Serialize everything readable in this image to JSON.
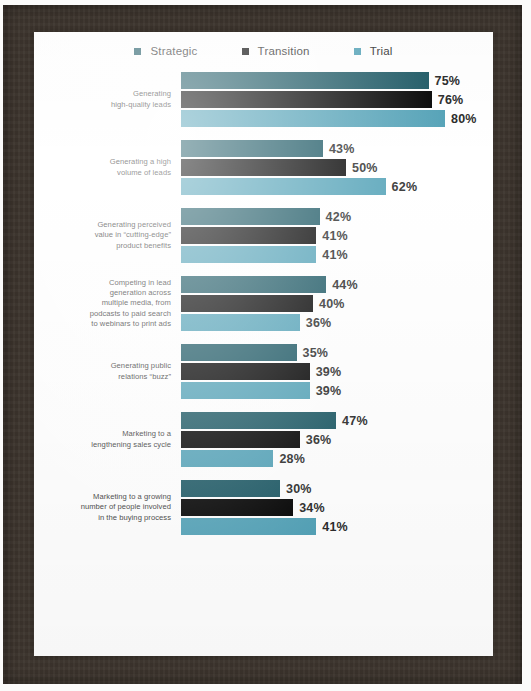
{
  "frame": {
    "border_color": "#3c342d",
    "page_color": "#ffffff"
  },
  "legend": {
    "position": "top-center",
    "items": [
      {
        "label": "Strategic",
        "color": "#1f5a66"
      },
      {
        "label": "Transition",
        "color": "#050505"
      },
      {
        "label": "Trial",
        "color": "#55a3b8"
      }
    ]
  },
  "chart_data": {
    "type": "bar",
    "orientation": "horizontal",
    "title": "",
    "subtitle": "",
    "xlabel": "",
    "ylabel": "",
    "xlim": [
      0,
      100
    ],
    "grid": false,
    "legend_position": "top-center",
    "value_suffix": "%",
    "categories": [
      "Generating\nhigh-quality leads",
      "Generating a high\nvolume of leads",
      "Generating perceived\nvalue in “cutting-edge”\nproduct benefits",
      "Competing in lead\ngeneration across\nmultiple media, from\npodcasts to paid search\nto webinars to print ads",
      "Generating public\nrelations “buzz”",
      "Marketing to a\nlengthening sales cycle",
      "Marketing to a growing\nnumber of people involved\nin the buying process"
    ],
    "series": [
      {
        "name": "Strategic",
        "color": "#1f5a66",
        "values": [
          75,
          43,
          42,
          44,
          35,
          47,
          30
        ]
      },
      {
        "name": "Transition",
        "color": "#050505",
        "values": [
          76,
          50,
          41,
          40,
          39,
          36,
          34
        ]
      },
      {
        "name": "Trial",
        "color": "#55a3b8",
        "values": [
          80,
          62,
          41,
          36,
          39,
          28,
          41
        ]
      }
    ],
    "data_labels": [
      [
        "75%",
        "76%",
        "80%"
      ],
      [
        "43%",
        "50%",
        "62%"
      ],
      [
        "42%",
        "41%",
        "41%"
      ],
      [
        "44%",
        "40%",
        "36%"
      ],
      [
        "35%",
        "39%",
        "39%"
      ],
      [
        "47%",
        "36%",
        "28%"
      ],
      [
        "30%",
        "34%",
        "41%"
      ]
    ]
  },
  "scale": {
    "px_per_percent": 3.3
  }
}
